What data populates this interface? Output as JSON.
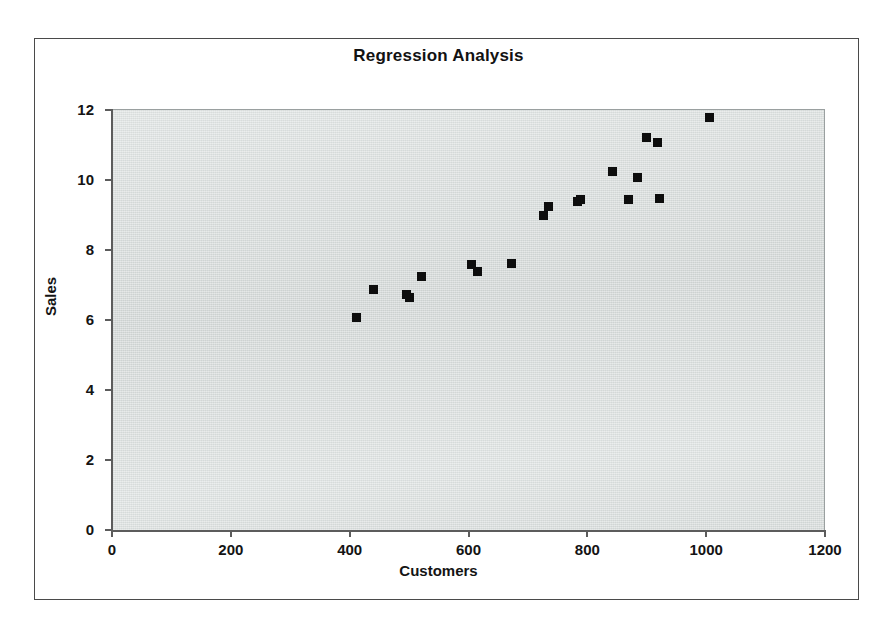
{
  "chart_data": {
    "type": "scatter",
    "title": "Regression Analysis",
    "xlabel": "Customers",
    "ylabel": "Sales",
    "xlim": [
      0,
      1200
    ],
    "ylim": [
      0,
      12
    ],
    "xticks": [
      0,
      200,
      400,
      600,
      800,
      1000,
      1200
    ],
    "yticks": [
      0,
      2,
      4,
      6,
      8,
      10,
      12
    ],
    "xtick_labels": [
      "0",
      "200",
      "400",
      "600",
      "800",
      "1000",
      "1200"
    ],
    "ytick_labels": [
      "0",
      "2",
      "4",
      "6",
      "8",
      "10",
      "12"
    ],
    "grid": false,
    "legend": false,
    "marker": "square",
    "marker_color": "#0d0d0d",
    "plot_background": "#d9dedd",
    "series": [
      {
        "name": "Sales vs Customers",
        "points": [
          {
            "x": 410,
            "y": 6.1
          },
          {
            "x": 440,
            "y": 6.9
          },
          {
            "x": 495,
            "y": 6.75
          },
          {
            "x": 500,
            "y": 6.65
          },
          {
            "x": 520,
            "y": 7.25
          },
          {
            "x": 605,
            "y": 7.6
          },
          {
            "x": 615,
            "y": 7.4
          },
          {
            "x": 672,
            "y": 7.62
          },
          {
            "x": 726,
            "y": 9.0
          },
          {
            "x": 733,
            "y": 9.25
          },
          {
            "x": 782,
            "y": 9.4
          },
          {
            "x": 787,
            "y": 9.45
          },
          {
            "x": 841,
            "y": 10.25
          },
          {
            "x": 868,
            "y": 9.45
          },
          {
            "x": 884,
            "y": 10.1
          },
          {
            "x": 899,
            "y": 11.22
          },
          {
            "x": 917,
            "y": 11.1
          },
          {
            "x": 921,
            "y": 9.48
          },
          {
            "x": 1005,
            "y": 11.8
          }
        ]
      }
    ]
  }
}
